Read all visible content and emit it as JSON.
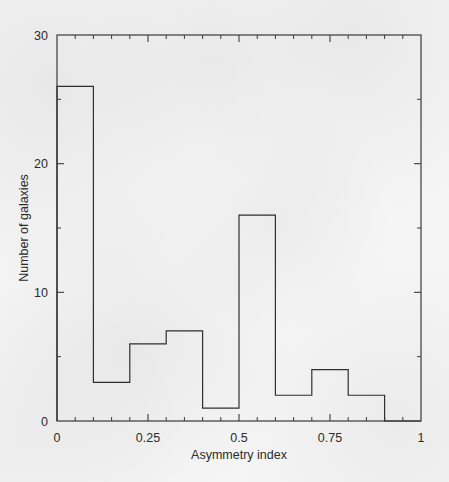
{
  "chart_data": {
    "type": "bar",
    "title": "",
    "subtitle": "",
    "xlabel": "Asymmetry index",
    "ylabel": "Number of galaxies",
    "xlim": [
      0,
      1
    ],
    "ylim": [
      0,
      30
    ],
    "grid": false,
    "legend": null,
    "bin_width": 0.1,
    "bin_edges": [
      0,
      0.1,
      0.2,
      0.3,
      0.4,
      0.5,
      0.6,
      0.7,
      0.8,
      0.9,
      1.0
    ],
    "categories": [
      "0.0-0.1",
      "0.1-0.2",
      "0.2-0.3",
      "0.3-0.4",
      "0.4-0.5",
      "0.5-0.6",
      "0.6-0.7",
      "0.7-0.8",
      "0.8-0.9",
      "0.9-1.0"
    ],
    "values": [
      26,
      3,
      6,
      7,
      1,
      16,
      2,
      4,
      2,
      0
    ],
    "x_ticks": [
      {
        "value": 0,
        "label": "0"
      },
      {
        "value": 0.25,
        "label": "0.25"
      },
      {
        "value": 0.5,
        "label": "0.5"
      },
      {
        "value": 0.75,
        "label": "0.75"
      },
      {
        "value": 1,
        "label": "1"
      }
    ],
    "x_minor_ticks": [
      0.05,
      0.1,
      0.15,
      0.2,
      0.3,
      0.35,
      0.4,
      0.45,
      0.55,
      0.6,
      0.65,
      0.7,
      0.8,
      0.85,
      0.9,
      0.95
    ],
    "y_ticks": [
      {
        "value": 0,
        "label": "0"
      },
      {
        "value": 10,
        "label": "10"
      },
      {
        "value": 20,
        "label": "20"
      },
      {
        "value": 30,
        "label": "30"
      }
    ],
    "y_minor_ticks": [
      5,
      15,
      25
    ],
    "colors": {
      "line": "#2f2f2f",
      "axis": "#3a3a3a",
      "text": "#2b2b2b",
      "background": "#f5f5f5",
      "fill": "none"
    }
  }
}
